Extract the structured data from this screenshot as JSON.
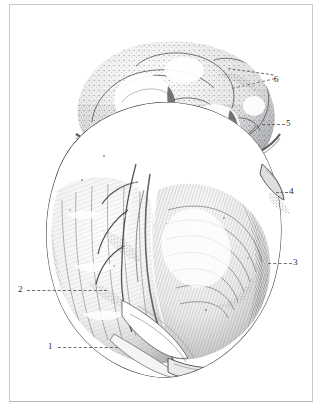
{
  "plate": {
    "title": "Anatomical engraving of the heart",
    "description": "Monochrome stipple and line engraving of a human heart seen from the sternocostal aspect, with epicardial fat and the auricles at the apex of the view, annotated with six numbered leader lines.",
    "medium": "line and stipple engraving",
    "palette": {
      "paper": "#ffffff",
      "ink": "#2b2b2b",
      "frame": "#c9cbcd",
      "leader": "#6d6f72"
    }
  },
  "figure": {
    "name": "heart-engraving",
    "ink_dark": "#2f3032",
    "ink_mid": "#6a6c6f",
    "ink_light": "#a9abad",
    "highlight": "#ffffff"
  },
  "annotations": [
    {
      "id": "label-6",
      "number": "6",
      "x": 274,
      "y": 75,
      "leaders": [
        {
          "x": 228,
          "y": 68,
          "length": 46,
          "angle": 8
        },
        {
          "x": 232,
          "y": 88,
          "length": 44,
          "angle": -13
        }
      ]
    },
    {
      "id": "label-5",
      "number": "5",
      "x": 286,
      "y": 119,
      "leaders": [
        {
          "x": 262,
          "y": 124,
          "length": 23,
          "angle": 0
        }
      ]
    },
    {
      "id": "label-4",
      "number": "4",
      "x": 289,
      "y": 187,
      "leaders": [
        {
          "x": 276,
          "y": 192,
          "length": 12,
          "angle": 0
        }
      ]
    },
    {
      "id": "label-3",
      "number": "3",
      "x": 293,
      "y": 258,
      "leaders": [
        {
          "x": 268,
          "y": 263,
          "length": 24,
          "angle": 0
        }
      ]
    },
    {
      "id": "label-2",
      "number": "2",
      "x": 18,
      "y": 285,
      "leaders": [
        {
          "x": 27,
          "y": 290,
          "length": 80,
          "angle": 0
        }
      ]
    },
    {
      "id": "label-1",
      "number": "1",
      "x": 48,
      "y": 342,
      "leaders": [
        {
          "x": 58,
          "y": 347,
          "length": 60,
          "angle": 0
        }
      ]
    }
  ]
}
